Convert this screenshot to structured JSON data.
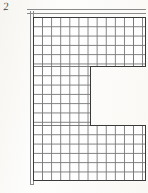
{
  "figure": {
    "label": "2",
    "title": "",
    "kind": "scanned-technical-drawing"
  },
  "canvas": {
    "width_px": 148,
    "height_px": 193,
    "background_color": "#fdfdfc",
    "ink_color": "#3a3a3a",
    "grid_line_color": "#6e6e6e",
    "wall_line_color": "#8a8a8a"
  },
  "drawing": {
    "shape_name": "c-shaped-grid-plan",
    "description": "Rectangular gridded plan with a rectangular notch removed from the right middle, forming a C / reverse-E profile.",
    "grid": {
      "cell_width_px": 9.1,
      "cell_height_px": 9.3,
      "columns_full_width": 12,
      "columns_middle_arm": 6,
      "rows_upper_band": 5,
      "rows_middle_arm": 6,
      "rows_lower_band": 6
    },
    "zones": [
      {
        "name": "upper-band",
        "x": 33,
        "y": 17,
        "width": 112,
        "height": 50,
        "columns": 12,
        "rows": 5
      },
      {
        "name": "middle-arm",
        "x": 33,
        "y": 66,
        "width": 57,
        "height": 60,
        "columns": 6,
        "rows": 6
      },
      {
        "name": "lower-band",
        "x": 33,
        "y": 125,
        "width": 112,
        "height": 55,
        "columns": 12,
        "rows": 6
      }
    ],
    "notch": {
      "name": "right-middle-notch",
      "x": 90,
      "y": 66,
      "width": 56,
      "height": 59,
      "filled": false
    },
    "walls": [
      {
        "name": "top-double-wall",
        "orientation": "horizontal",
        "x": 27,
        "y": 9,
        "length": 119
      },
      {
        "name": "left-double-wall",
        "orientation": "vertical",
        "x": 30,
        "y": 11,
        "length": 174
      }
    ]
  }
}
